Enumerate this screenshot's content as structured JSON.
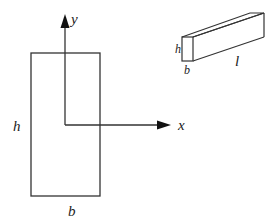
{
  "diagram": {
    "type": "beam cross-section with axes",
    "cross_section": {
      "width_label": "b",
      "height_label": "h",
      "rect": {
        "x": 31,
        "y": 53,
        "w": 69,
        "h": 143
      }
    },
    "axes": {
      "x_label": "x",
      "y_label": "y",
      "origin": {
        "x": 65,
        "y": 125
      },
      "x_axis_end": {
        "x": 170,
        "y": 125
      },
      "y_axis_end": {
        "x": 65,
        "y": 15
      }
    },
    "beam_3d": {
      "height_label": "h",
      "width_label": "b",
      "length_label": "l"
    },
    "colors": {
      "line": "#333333",
      "background": "#ffffff"
    }
  }
}
